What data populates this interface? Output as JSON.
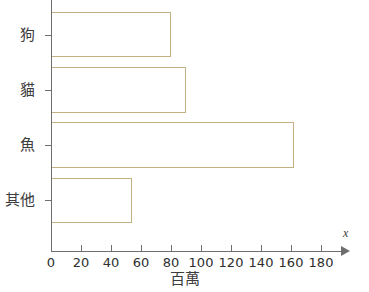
{
  "chart_data": {
    "type": "bar",
    "orientation": "horizontal",
    "title": "",
    "subtitle": "",
    "categories": [
      "狗",
      "貓",
      "魚",
      "其他"
    ],
    "values": [
      80,
      90,
      162,
      54
    ],
    "xlabel": "百萬",
    "ylabel": "",
    "xlim": [
      0,
      190
    ],
    "ylim": [
      0,
      4
    ],
    "xticks": [
      0,
      20,
      40,
      60,
      80,
      100,
      120,
      140,
      160,
      180
    ],
    "xtick_labels": [
      "0",
      "20",
      "40",
      "60",
      "80",
      "100",
      "120",
      "140",
      "160",
      "180"
    ],
    "grid": false,
    "legend": null,
    "axis_arrow_label": "x",
    "bar_edge_color": "#c3b183",
    "bar_fill_color": "#ffffff",
    "axis_color": "#6e6e6e",
    "text_color": "#3c3c3c"
  },
  "axis": {
    "arrow_label": "x",
    "x_title": "百萬"
  }
}
